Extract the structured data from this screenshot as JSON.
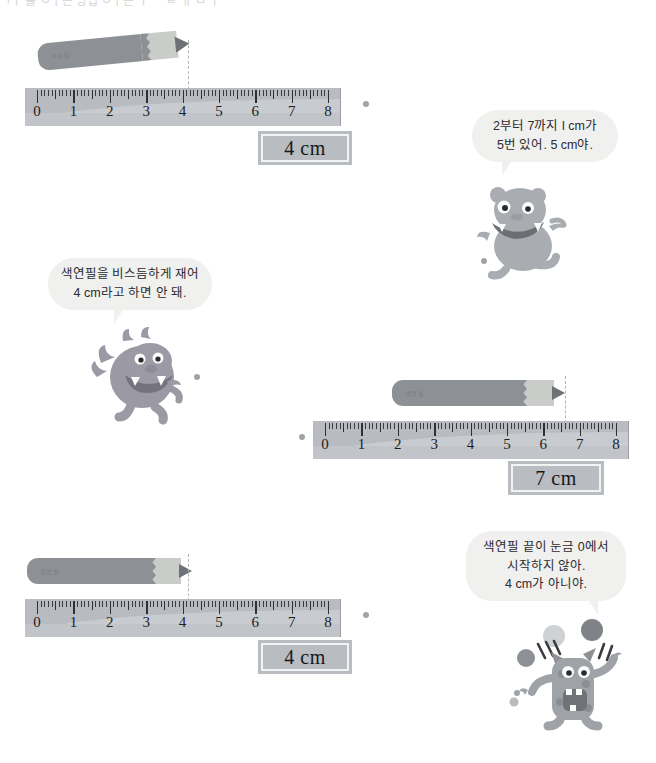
{
  "page": {
    "top_cropped_text": "ㄱㅣ 를 ㅇㅏ는 방법 ㅇㅏ는 ㅣ ㅡ ㄹ  ㅐ ㅁ ㅣ",
    "background_color": "#ffffff",
    "accent_color": "#b9bdc1"
  },
  "exercises": [
    {
      "id": "exercise-1",
      "ruler": {
        "unit_label": "cm",
        "ticks": [
          0,
          1,
          2,
          3,
          4,
          5,
          6,
          7,
          8
        ],
        "min": 0,
        "max": 8
      },
      "pencil": {
        "label": "색연필",
        "start_value": 0,
        "end_value": 4,
        "tilted": true,
        "body_color": "#8d9196",
        "wood_color": "#c9ccc9"
      },
      "measure_line_value": 4,
      "answer": "4 cm"
    },
    {
      "id": "exercise-2",
      "ruler": {
        "unit_label": "cm",
        "ticks": [
          0,
          1,
          2,
          3,
          4,
          5,
          6,
          7,
          8
        ],
        "min": 0,
        "max": 8
      },
      "pencil": {
        "label": "색연필",
        "start_value": 2,
        "end_value": 7,
        "tilted": false,
        "body_color": "#8d9196",
        "wood_color": "#c9ccc9"
      },
      "measure_line_value": 7,
      "answer": "7 cm"
    },
    {
      "id": "exercise-3",
      "ruler": {
        "unit_label": "cm",
        "ticks": [
          0,
          1,
          2,
          3,
          4,
          5,
          6,
          7,
          8
        ],
        "min": 0,
        "max": 8
      },
      "pencil": {
        "label": "색연필",
        "start_value": 0,
        "end_value": 4,
        "tilted": false,
        "body_color": "#8d9196",
        "wood_color": "#c9ccc9"
      },
      "measure_line_value": 4,
      "answer": "4 cm"
    }
  ],
  "speech_bubbles": [
    {
      "id": "bubble-frog",
      "lines": [
        "2부터 7까지 l cm가",
        "5번 있어. 5 cm야."
      ],
      "speaker": "frog-monster"
    },
    {
      "id": "bubble-dragon",
      "lines": [
        "색연필을 비스듬하게 재어",
        "4 cm라고 하면 안 돼."
      ],
      "speaker": "dragon-monster"
    },
    {
      "id": "bubble-juggler",
      "lines": [
        "색연필 끝이 눈금 0에서",
        "시작하지 않아.",
        "4 cm가 아니야."
      ],
      "speaker": "juggling-monster"
    }
  ],
  "characters": [
    {
      "id": "frog-monster",
      "name": "frog-monster",
      "color": "#a8acb0"
    },
    {
      "id": "dragon-monster",
      "name": "winged-dragon-monster",
      "color": "#9b99a4"
    },
    {
      "id": "juggling-monster",
      "name": "juggling-monster",
      "color": "#9fa3a7"
    }
  ]
}
